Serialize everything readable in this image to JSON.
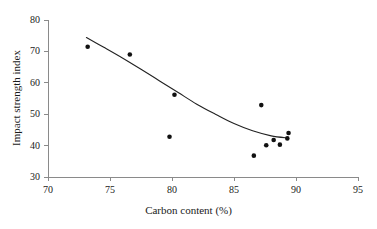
{
  "chart_data": {
    "type": "scatter",
    "title": "",
    "xlabel": "Carbon content (%)",
    "ylabel": "Impact strength index",
    "xlim": [
      70,
      95
    ],
    "ylim": [
      30,
      80
    ],
    "xticks": [
      70,
      75,
      80,
      85,
      90,
      95
    ],
    "yticks": [
      30,
      40,
      50,
      60,
      70,
      80
    ],
    "grid": false,
    "legend": "none",
    "marker_color": "#111111",
    "line_color": "#222222",
    "axis_color": "#8a8a8a",
    "background": "#ffffff",
    "x": [
      73.2,
      76.6,
      79.8,
      80.2,
      86.6,
      87.2,
      87.6,
      88.2,
      88.7,
      89.3,
      89.4
    ],
    "y": [
      71.5,
      69.0,
      42.8,
      56.2,
      36.8,
      52.9,
      40.1,
      41.8,
      40.3,
      42.3,
      44.0
    ],
    "points": [
      {
        "x": 73.2,
        "y": 71.5
      },
      {
        "x": 76.6,
        "y": 69.0
      },
      {
        "x": 79.8,
        "y": 42.8
      },
      {
        "x": 80.2,
        "y": 56.2
      },
      {
        "x": 86.6,
        "y": 36.8
      },
      {
        "x": 87.2,
        "y": 52.9
      },
      {
        "x": 87.6,
        "y": 40.1
      },
      {
        "x": 88.2,
        "y": 41.8
      },
      {
        "x": 88.7,
        "y": 40.3
      },
      {
        "x": 89.3,
        "y": 42.3
      },
      {
        "x": 89.4,
        "y": 44.0
      }
    ],
    "fit_curve": {
      "label": "fitted trend line",
      "x": [
        73.1,
        74.5,
        76.0,
        77.5,
        79.0,
        80.5,
        82.0,
        83.5,
        85.0,
        86.5,
        88.0,
        89.4
      ],
      "y": [
        74.4,
        71.3,
        67.9,
        64.3,
        60.6,
        56.9,
        53.2,
        50.0,
        47.0,
        44.7,
        43.1,
        42.4
      ]
    }
  },
  "axes": {
    "x_tick_labels": [
      "70",
      "75",
      "80",
      "85",
      "90",
      "95"
    ],
    "y_tick_labels": [
      "30",
      "40",
      "50",
      "60",
      "70",
      "80"
    ],
    "x_title": "Carbon content (%)",
    "y_title": "Impact strength index"
  }
}
